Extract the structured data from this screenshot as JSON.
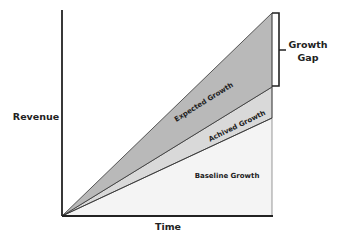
{
  "diagram": {
    "y_axis_label": "Revenue",
    "x_axis_label": "Time",
    "regions": [
      {
        "name": "expected",
        "label": "Expected Growth",
        "color": "#b9b9b9"
      },
      {
        "name": "achieved",
        "label": "Achived Growth",
        "color": "#d9d9d9"
      },
      {
        "name": "baseline",
        "label": "Baseline Growth",
        "color": "#f4f4f4"
      }
    ],
    "bracket_label_line1": "Growth",
    "bracket_label_line2": "Gap"
  }
}
